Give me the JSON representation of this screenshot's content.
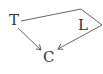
{
  "diagram": {
    "nodes": [
      {
        "id": "T",
        "label": "T"
      },
      {
        "id": "L",
        "label": "L"
      },
      {
        "id": "C",
        "label": "C"
      }
    ],
    "edges": [
      {
        "from": "T",
        "to": "C",
        "type": "arrow"
      },
      {
        "from": "T",
        "to": "C",
        "type": "arrow",
        "route": "via top-right around L"
      }
    ],
    "colors": {
      "line": "#555555",
      "text": "#333333",
      "background": "#ffffff"
    }
  }
}
